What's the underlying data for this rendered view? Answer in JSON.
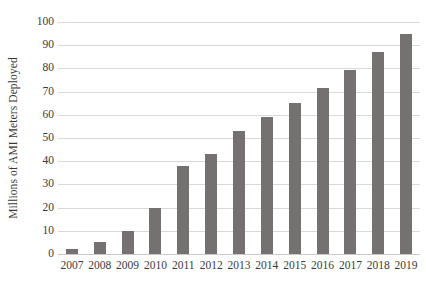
{
  "chart_data": {
    "type": "bar",
    "title": "",
    "subtitle": "",
    "xlabel": "",
    "ylabel": "Millions of AMI Meters Deployed",
    "categories": [
      "2007",
      "2008",
      "2009",
      "2010",
      "2011",
      "2012",
      "2013",
      "2014",
      "2015",
      "2016",
      "2017",
      "2018",
      "2019"
    ],
    "values": [
      2,
      5,
      10,
      20,
      38,
      43,
      53,
      59,
      65,
      71.5,
      79.5,
      87,
      95
    ],
    "series": [
      {
        "name": "AMI Meters Deployed",
        "values": [
          2,
          5,
          10,
          20,
          38,
          43,
          53,
          59,
          65,
          71.5,
          79.5,
          87,
          95
        ]
      }
    ],
    "ylim": [
      0,
      100
    ],
    "ytick_labels": [
      "0",
      "10",
      "20",
      "30",
      "40",
      "50",
      "60",
      "70",
      "80",
      "90",
      "100"
    ],
    "ytick_values": [
      0,
      10,
      20,
      30,
      40,
      50,
      60,
      70,
      80,
      90,
      100
    ],
    "grid": "horizontal",
    "legend": "none",
    "bar_color": "#767171",
    "gridline_color": "#d9d9d9",
    "background_color": "#ffffff",
    "text_color": "#3a3a3a"
  }
}
